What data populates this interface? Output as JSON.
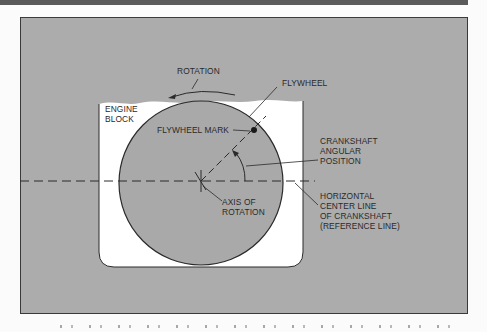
{
  "figure": {
    "colors": {
      "background_panel": "#acacac",
      "engine_block": "#ffffff",
      "flywheel": "#a9a9a9",
      "lines": "#2a2a2a"
    },
    "labels": {
      "rotation": "ROTATION",
      "flywheel": "FLYWHEEL",
      "engine_block": "ENGINE\nBLOCK",
      "flywheel_mark": "FLYWHEEL MARK",
      "crankshaft_angular_position": "CRANKSHAFT\nANGULAR\nPOSITION",
      "axis_of_rotation": "AXIS OF\nROTATION",
      "horizontal_center_line": "HORIZONTAL\nCENTER LINE\nOF CRANKSHAFT\n(REFERENCE LINE)"
    }
  }
}
